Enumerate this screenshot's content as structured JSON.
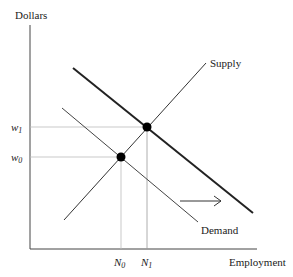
{
  "diagram": {
    "type": "labor-market supply and demand shift",
    "y_axis_label": "Dollars",
    "x_axis_label": "Employment",
    "curves": [
      {
        "name": "Supply",
        "label": "Supply"
      },
      {
        "name": "Demand (initial)",
        "label": "Demand"
      },
      {
        "name": "Demand (shifted right)",
        "label": ""
      }
    ],
    "equilibria": [
      {
        "wage_label": "w",
        "wage_sub": "0",
        "employment_label": "N",
        "employment_sub": "0"
      },
      {
        "wage_label": "w",
        "wage_sub": "1",
        "employment_label": "N",
        "employment_sub": "1"
      }
    ],
    "shift_arrow": "right",
    "colors": {
      "line": "#333333",
      "guide": "#bbbbbb",
      "dot": "#000000"
    }
  }
}
